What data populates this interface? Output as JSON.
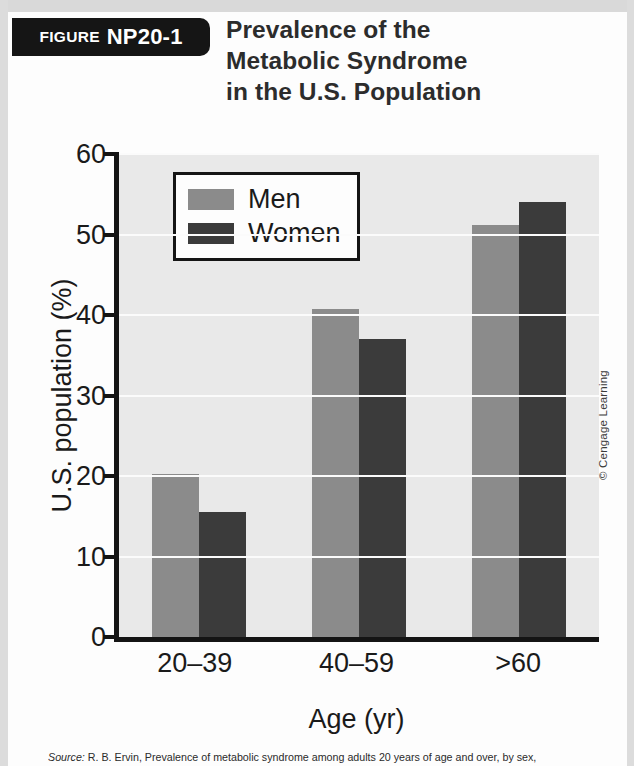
{
  "figure": {
    "tag_word": "FIGURE",
    "tag_number": "NP20-1",
    "title_lines": [
      "Prevalence of the",
      "Metabolic Syndrome",
      "in the U.S. Population"
    ]
  },
  "credit": "© Cengage Learning",
  "source": {
    "label": "Source:",
    "text": " R. B. Ervin, Prevalence of metabolic syndrome among adults 20 years of age and over, by sex,"
  },
  "colors": {
    "men": "#8b8b8b",
    "women": "#3b3b3b",
    "plot_background": "#e9e9e9",
    "axis": "#141414",
    "gridline": "#fbfbfb",
    "tag_background": "#151515",
    "text": "#1a1a1a"
  },
  "chart_data": {
    "type": "bar",
    "title": "Prevalence of the Metabolic Syndrome in the U.S. Population",
    "xlabel": "Age (yr)",
    "ylabel": "U.S. population (%)",
    "categories": [
      "20–39",
      "40–59",
      ">60"
    ],
    "series": [
      {
        "name": "Men",
        "values": [
          20.3,
          40.8,
          51.2
        ]
      },
      {
        "name": "Women",
        "values": [
          15.5,
          37.0,
          54.1
        ]
      }
    ],
    "ylim": [
      0,
      60
    ],
    "yticks": [
      0,
      10,
      20,
      30,
      40,
      50,
      60
    ],
    "ytick_labels": [
      "0",
      "10",
      "20",
      "30",
      "40",
      "50",
      "60"
    ],
    "grid": true,
    "legend_position": "upper-left-inside"
  }
}
